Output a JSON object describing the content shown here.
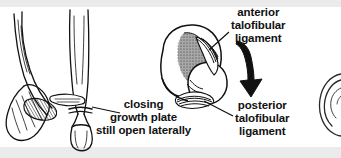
{
  "figure": {
    "type": "medical-anatomical-illustration",
    "width": 341,
    "height": 158,
    "background_color": "#ffffff",
    "band_color": "#ebebeb",
    "ink_color": "#111111",
    "shade_color": "#a8a8a8"
  },
  "labels": {
    "anterior_ligament": {
      "line1": "anterior",
      "line2": "talofibular",
      "line3": "ligament"
    },
    "posterior_ligament": {
      "line1": "posterior",
      "line2": "talofibular",
      "line3": "ligament"
    },
    "growth_plate": {
      "line1": "closing",
      "line2": "growth plate",
      "line3": "still open laterally"
    }
  },
  "panels": {
    "left": {
      "name": "distal-tibia-fibula-anterior-view",
      "description": "anterior view of distal tibia and fibula with medial malleolus and partially closed physis"
    },
    "center": {
      "name": "ankle-cross-section",
      "description": "oblique view of talus dome and fibula with anterior and posterior talofibular ligaments, shaded articular region"
    },
    "right": {
      "name": "adjacent-figure-cropped",
      "description": "edge of neighbouring illustration cut off by frame"
    }
  },
  "annotations": {
    "force_arrow": {
      "name": "force-direction-arrow",
      "description": "thick curved black arrow indicating direction of injuring force, pointing down and to the right"
    },
    "leader_lines": [
      {
        "name": "leader-anterior-talofibular",
        "from": "anterior talofibular ligament label",
        "to": "anterior hatched ligament band"
      },
      {
        "name": "leader-posterior-talofibular",
        "from": "posterior talofibular ligament label",
        "to": "posterior hatched ligament band"
      },
      {
        "name": "leader-growth-plate",
        "from": "closing growth plate label",
        "to": "physis of distal tibia"
      }
    ]
  }
}
